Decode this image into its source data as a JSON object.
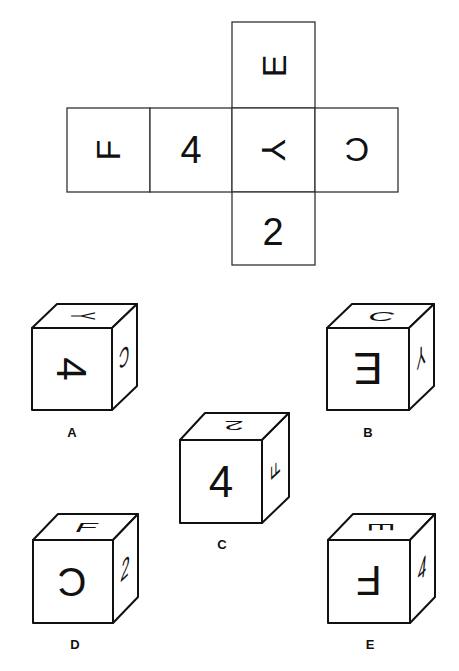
{
  "net": {
    "faces": [
      {
        "id": "top",
        "symbol": "E",
        "rotation": -90
      },
      {
        "id": "left2",
        "symbol": "F",
        "rotation": -90
      },
      {
        "id": "left1",
        "symbol": "4",
        "rotation": 0
      },
      {
        "id": "center",
        "symbol": "Y",
        "rotation": 90
      },
      {
        "id": "right",
        "symbol": "C",
        "rotation": 180
      },
      {
        "id": "bottom",
        "symbol": "2",
        "rotation": 0
      }
    ]
  },
  "options": [
    {
      "label": "A",
      "front": "4",
      "front_rot": 90,
      "top": "Y",
      "top_rot": 90,
      "side": "C",
      "side_rot": 180
    },
    {
      "label": "B",
      "front": "E",
      "front_rot": 180,
      "top": "C",
      "top_rot": 0,
      "side": "Y",
      "side_rot": 180
    },
    {
      "label": "C",
      "front": "4",
      "front_rot": 0,
      "top": "2",
      "top_rot": 180,
      "side": "F",
      "side_rot": -90
    },
    {
      "label": "D",
      "front": "C",
      "front_rot": 180,
      "top": "F",
      "top_rot": 0,
      "side": "2",
      "side_rot": 0
    },
    {
      "label": "E",
      "front": "F",
      "front_rot": 180,
      "top": "E",
      "top_rot": 90,
      "side": "4",
      "side_rot": 0
    }
  ]
}
